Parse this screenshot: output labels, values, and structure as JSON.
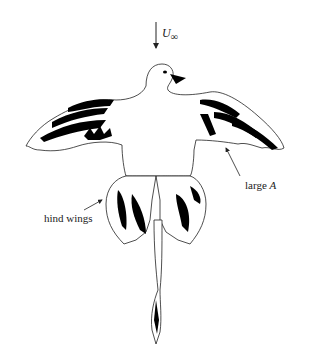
{
  "figure": {
    "colors": {
      "outline": "#222222",
      "feather_fill": "#000000",
      "background": "#ffffff"
    }
  },
  "labels": {
    "freestream": {
      "symbol": "U",
      "subscript": "∞"
    },
    "large_A": {
      "text": "large ",
      "italic": "A"
    },
    "hind_wings": {
      "text": "hind wings"
    }
  },
  "arrows": [
    {
      "name": "freestream-arrow",
      "direction": "down"
    },
    {
      "name": "large-A-pointer",
      "target": "forewing trailing edge"
    },
    {
      "name": "hind-wings-pointer",
      "target": "left hind wing"
    }
  ]
}
